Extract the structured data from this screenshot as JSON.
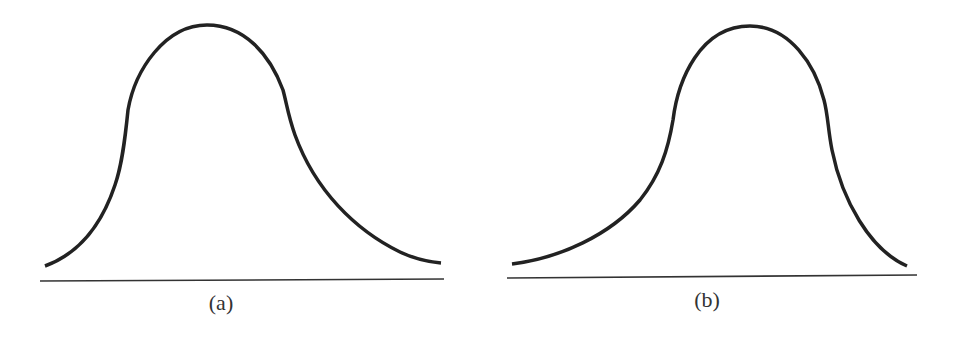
{
  "panels": [
    {
      "id": "a",
      "label": "(a)",
      "description": "Right-skewed (positively skewed) unimodal distribution curve"
    },
    {
      "id": "b",
      "label": "(b)",
      "description": "Left-skewed (negatively skewed) unimodal distribution curve"
    }
  ],
  "colors": {
    "curve": "#222222",
    "baseline": "#333333",
    "background": "#ffffff"
  }
}
